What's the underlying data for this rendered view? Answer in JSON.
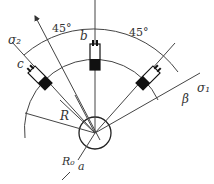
{
  "diagram": {
    "labels": {
      "sigma2": "σ₂",
      "sigma1": "σ₁",
      "gauge_a": "a",
      "gauge_b": "b",
      "gauge_c": "c",
      "angle_left": "45°",
      "angle_right": "45°",
      "beta": "β",
      "radius": "R",
      "hole_radius": "R₀"
    },
    "colors": {
      "line": "#444444",
      "gauge_fill": "#111111"
    }
  }
}
